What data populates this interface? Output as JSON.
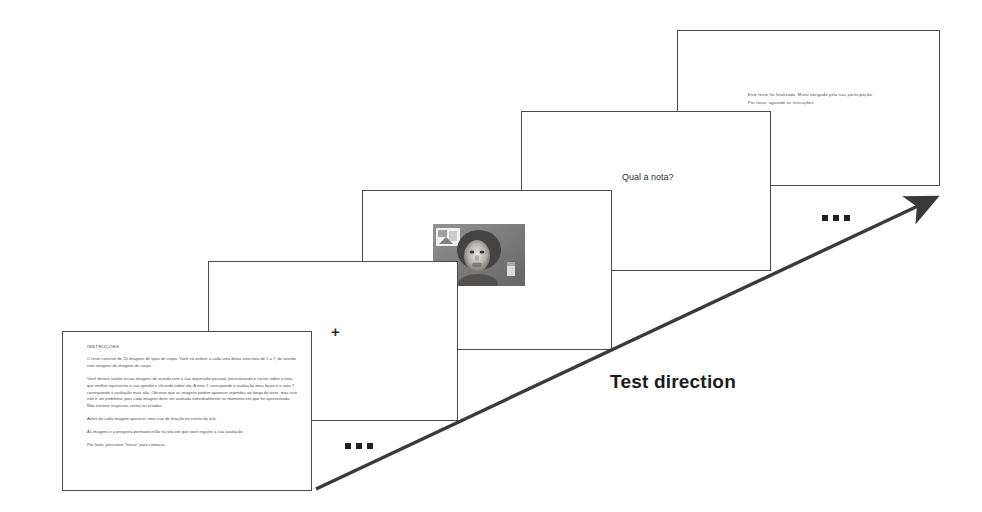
{
  "figure": {
    "name": "experimental-trial-sequence",
    "background_color": "#ffffff",
    "slide_border_color": "#4a4a4a",
    "text_color": "#4d4d4d"
  },
  "direction": {
    "label": "Test direction",
    "arrow_icon": "diagonal-arrow-up-right-icon",
    "start_ellipsis": "...",
    "end_ellipsis": "..."
  },
  "slides": [
    {
      "id": "instructions",
      "name": "instructions-slide",
      "title": "INSTRUÇÕES",
      "paragraphs": [
        "O teste consiste de 20 imagens de tipos de corpo. Você irá atribuir a cada uma delas uma nota de 1 a 7, de acordo com imagens de imagens de corpo.",
        "Você deverá avaliar essas imagens de acordo com a sua impressão pessoal, posicionando o cursor sobre a nota que melhor representa a sua opinião e clicando sobre ela. A nota 1 corresponde à avaliação mais baixa e a nota 7 corresponde à avaliação mais alta. Observe que as imagens podem aparecer repetidas ao longo do teste, mas isso não é um problema, pois cada imagem deve ser avaliada individualmente no momento em que for apresentada. Não existem respostas certas ou erradas.",
        "Antes de cada imagem aparecer uma cruz de fixação no centro da tela.",
        "As imagens e a pergunta permanecerão na tela até que você registre a sua avaliação.",
        "Por favor, pressione \"Iniciar\" para começar."
      ]
    },
    {
      "id": "fixation",
      "name": "fixation-slide",
      "cross_symbol": "+"
    },
    {
      "id": "stimulus",
      "name": "stimulus-slide",
      "photo_alt": "grayscale-body-image-stimulus"
    },
    {
      "id": "rating",
      "name": "rating-slide",
      "prompt": "Qual a nota?"
    },
    {
      "id": "final",
      "name": "final-slide",
      "lines": [
        "Este teste foi finalizado. Muito obrigado pela sua participação.",
        "Por favor, aguarde as instruções."
      ]
    }
  ]
}
